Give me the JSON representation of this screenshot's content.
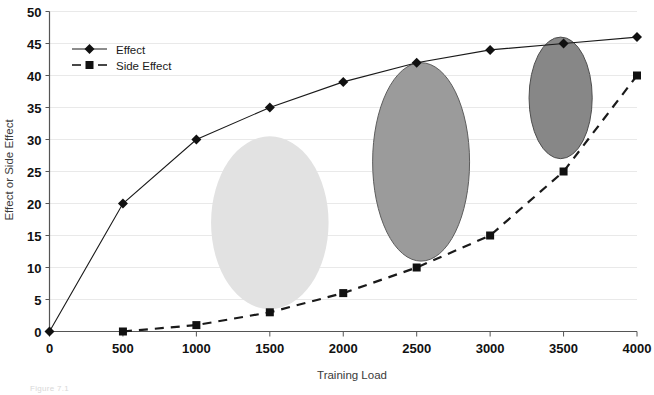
{
  "figure": {
    "caption": "Figure 7.1"
  },
  "chart_data": {
    "type": "line",
    "title": "",
    "xlabel": "Training Load",
    "ylabel": "Effect or Side Effect",
    "xlim": [
      0,
      4000
    ],
    "ylim": [
      0,
      50
    ],
    "xticks": [
      0,
      500,
      1000,
      1500,
      2000,
      2500,
      3000,
      3500,
      4000
    ],
    "yticks": [
      0,
      5,
      10,
      15,
      20,
      25,
      30,
      35,
      40,
      45,
      50
    ],
    "grid": "horizontal",
    "grid_color": "#e9e9e9",
    "legend_position": "top-left",
    "x": [
      0,
      500,
      1000,
      1500,
      2000,
      2500,
      3000,
      3500,
      4000
    ],
    "series": [
      {
        "name": "Effect",
        "marker": "diamond",
        "line_style": "solid",
        "color": "#1a1a1a",
        "x": [
          0,
          500,
          1000,
          1500,
          2000,
          2500,
          3000,
          3500,
          4000
        ],
        "values": [
          0,
          20,
          30,
          35,
          39,
          42,
          44,
          45,
          46
        ]
      },
      {
        "name": "Side Effect",
        "marker": "square",
        "line_style": "dashed",
        "color": "#1a1a1a",
        "x": [
          500,
          1000,
          1500,
          2000,
          2500,
          3000,
          3500,
          4000
        ],
        "values": [
          0,
          1,
          3,
          6,
          10,
          15,
          25,
          40
        ]
      }
    ],
    "annotations": [
      {
        "shape": "ellipse",
        "name": "zone-ellipse-light",
        "center_x": 1500,
        "center_y": 17,
        "radius_x": 400,
        "radius_y": 13.5,
        "fill": "#e2e2e2",
        "stroke": "none"
      },
      {
        "shape": "ellipse",
        "name": "zone-ellipse-medium",
        "center_x": 2530,
        "center_y": 26.5,
        "radius_x": 330,
        "radius_y": 15.5,
        "fill": "#9b9b9b",
        "stroke": "#5d5d5d"
      },
      {
        "shape": "ellipse",
        "name": "zone-ellipse-dark",
        "center_x": 3480,
        "center_y": 36.5,
        "radius_x": 215,
        "radius_y": 9.5,
        "fill": "#878787",
        "stroke": "#4e4e4e"
      }
    ]
  }
}
